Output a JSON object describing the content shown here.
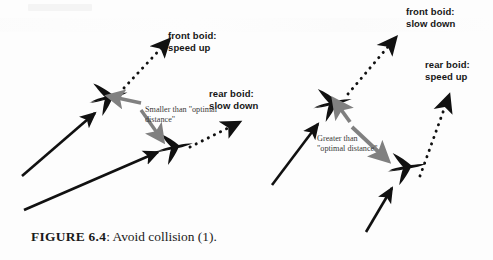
{
  "figure": {
    "caption_label": "FIGURE 6.4",
    "caption_text": ": Avoid collision (1).",
    "colors": {
      "ink": "#111111",
      "gray_arrow": "#808080",
      "background": "#fdfdfd",
      "annotation_text": "#3a3a3a"
    }
  },
  "panels": [
    {
      "id": "left",
      "name": "too-close-panel",
      "annotation": {
        "line1": "Smaller than \"optimal",
        "line2": "distance\""
      },
      "labels": [
        {
          "name": "front-boid-label-left",
          "line1": "front boid:",
          "line2": "speed up"
        },
        {
          "name": "rear-boid-label-left",
          "line1": "rear boid:",
          "line2": "slow down"
        }
      ],
      "boids": [
        {
          "name": "front-boid-left",
          "role": "front"
        },
        {
          "name": "rear-boid-left",
          "role": "rear"
        }
      ]
    },
    {
      "id": "right",
      "name": "too-far-panel",
      "annotation": {
        "line1": "Greater than",
        "line2": "\"optimal distance\""
      },
      "labels": [
        {
          "name": "front-boid-label-right",
          "line1": "front boid:",
          "line2": "slow down"
        },
        {
          "name": "rear-boid-label-right",
          "line1": "rear boid:",
          "line2": "speed up"
        }
      ],
      "boids": [
        {
          "name": "front-boid-right",
          "role": "front"
        },
        {
          "name": "rear-boid-right",
          "role": "rear"
        }
      ]
    }
  ]
}
